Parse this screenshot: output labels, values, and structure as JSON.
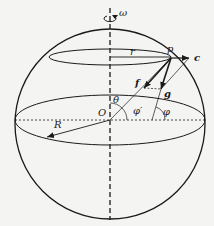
{
  "diagram": {
    "labels": {
      "omega": "ω",
      "r": "r",
      "p": "p",
      "c": "c",
      "f": "f",
      "g": "g",
      "theta": "θ",
      "O": "O",
      "phi_prime": "φ′",
      "phi": "φ",
      "R": "R"
    },
    "colors": {
      "stroke": "#1a1a1a",
      "background": "#f4f4f2"
    }
  }
}
